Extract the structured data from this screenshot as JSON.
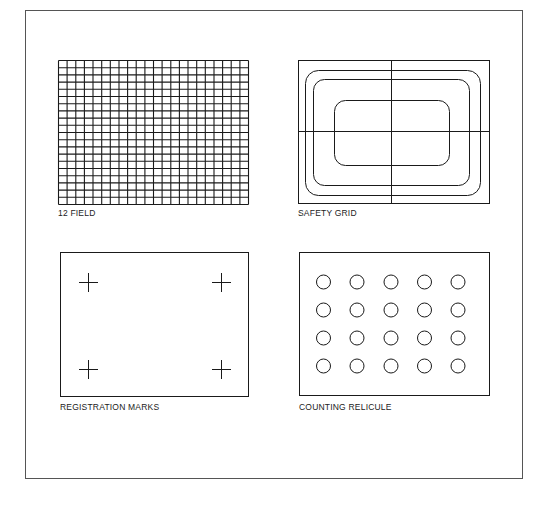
{
  "panels": [
    {
      "id": "twelve-field",
      "label": "12 FIELD",
      "columns": 22,
      "rows": 20
    },
    {
      "id": "safety-grid",
      "label": "SAFETY GRID",
      "nested_rounded_rects": 3,
      "crosshair": true
    },
    {
      "id": "registration-marks",
      "label": "REGISTRATION MARKS",
      "marks": 4
    },
    {
      "id": "counting-reticule",
      "label": "COUNTING RELICULE",
      "circle_columns": 5,
      "circle_rows": 4
    }
  ],
  "colors": {
    "line": "#1a1a1a",
    "frame": "#555555",
    "background": "#ffffff"
  }
}
